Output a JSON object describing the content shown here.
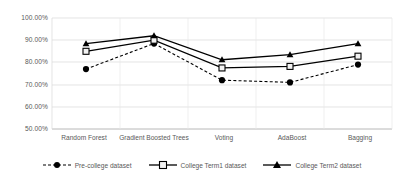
{
  "chart_data": {
    "type": "line",
    "title": "",
    "xlabel": "",
    "ylabel": "",
    "categories": [
      "Random Forest",
      "Gradient Boosted Trees",
      "Voting",
      "AdaBoost",
      "Bagging"
    ],
    "ylim": [
      50,
      100
    ],
    "yticks": [
      "50.00%",
      "60.00%",
      "70.00%",
      "80.00%",
      "90.00%",
      "100.00%"
    ],
    "ytick_values": [
      50,
      60,
      70,
      80,
      90,
      100
    ],
    "grid": true,
    "legend_position": "bottom",
    "series": [
      {
        "name": "Pre-college dataset",
        "values": [
          77.0,
          88.5,
          72.0,
          71.0,
          79.0
        ],
        "marker": "circle",
        "line_style": "dashed",
        "color": "#000000"
      },
      {
        "name": "College Term1 dataset",
        "values": [
          85.0,
          90.0,
          77.5,
          78.2,
          82.8
        ],
        "marker": "square",
        "line_style": "solid",
        "color": "#000000"
      },
      {
        "name": "College Term2 dataset",
        "values": [
          88.5,
          92.0,
          81.2,
          83.5,
          88.5
        ],
        "marker": "triangle",
        "line_style": "solid",
        "color": "#000000"
      }
    ]
  },
  "axis": {
    "tick_0": "50.00%",
    "tick_1": "60.00%",
    "tick_2": "70.00%",
    "tick_3": "80.00%",
    "tick_4": "90.00%",
    "tick_5": "100.00%"
  },
  "categories": {
    "c0": "Random Forest",
    "c1": "Gradient Boosted Trees",
    "c2": "Voting",
    "c3": "AdaBoost",
    "c4": "Bagging"
  },
  "legend": {
    "item_0": "Pre-college dataset",
    "item_1": "College Term1 dataset",
    "item_2": "College Term2 dataset"
  },
  "colors": {
    "series_line": "#000000",
    "gridline": "#d9d9d9",
    "axis_text": "#595959",
    "background": "#ffffff"
  }
}
